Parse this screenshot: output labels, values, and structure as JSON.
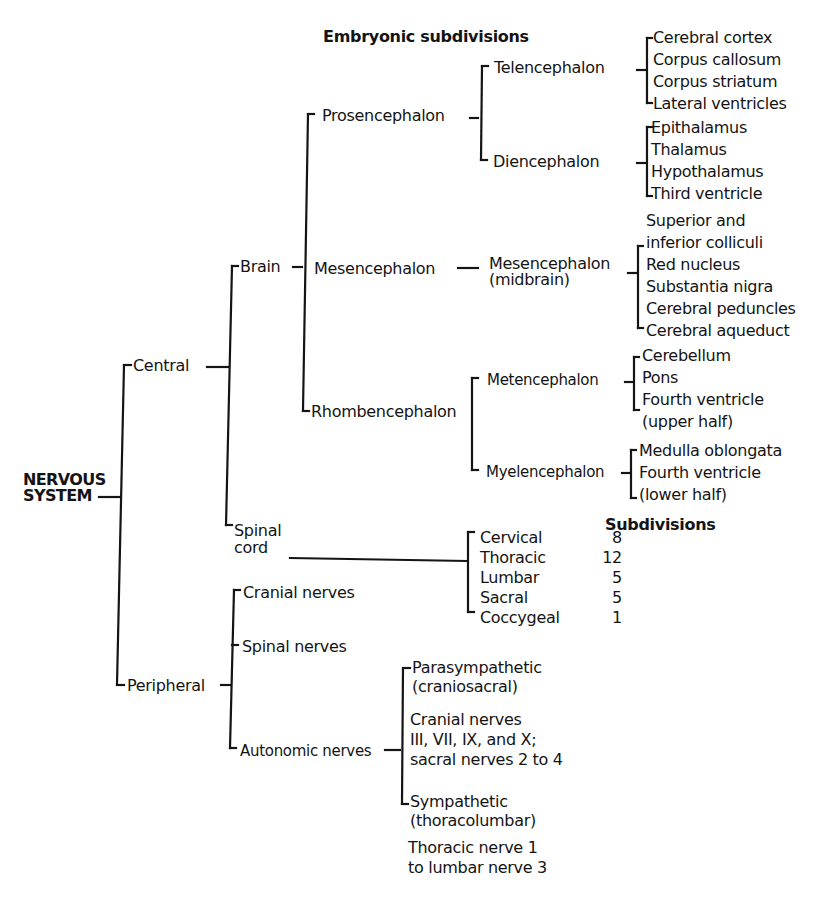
{
  "diagram": {
    "root": "NERVOUS SYSTEM",
    "root_lines": [
      "NERVOUS",
      "SYSTEM"
    ],
    "headers": {
      "embryonic": "Embryonic subdivisions",
      "subdivisions": "Subdivisions"
    },
    "level1": {
      "central": "Central",
      "peripheral": "Peripheral"
    },
    "central": {
      "brain": "Brain",
      "spinal_cord": [
        "Spinal",
        "cord"
      ],
      "embryonic": {
        "prosencephalon": "Prosencephalon",
        "mesencephalon": "Mesencephalon",
        "rhombencephalon": "Rhombencephalon"
      },
      "divisions": {
        "telencephalon": {
          "label": "Telencephalon",
          "structures": [
            "Cerebral cortex",
            "Corpus callosum",
            "Corpus striatum",
            "Lateral ventricles"
          ]
        },
        "diencephalon": {
          "label": "Diencephalon",
          "structures": [
            "Epithalamus",
            "Thalamus",
            "Hypothalamus",
            "Third ventricle"
          ]
        },
        "mesencephalon": {
          "label": [
            "Mesencephalon",
            "(midbrain)"
          ],
          "structures": [
            "Superior and",
            "inferior colliculi",
            "Red nucleus",
            "Substantia nigra",
            "Cerebral peduncles",
            "Cerebral aqueduct"
          ]
        },
        "metencephalon": {
          "label": "Metencephalon",
          "structures": [
            "Cerebellum",
            "Pons",
            "Fourth ventricle",
            "(upper half)"
          ]
        },
        "myelencephalon": {
          "label": "Myelencephalon",
          "structures": [
            "Medulla oblongata",
            "Fourth ventricle",
            "(lower half)"
          ]
        }
      },
      "spinal_subdivisions": [
        {
          "name": "Cervical",
          "count": "8"
        },
        {
          "name": "Thoracic",
          "count": "12"
        },
        {
          "name": "Lumbar",
          "count": "5"
        },
        {
          "name": "Sacral",
          "count": "5"
        },
        {
          "name": "Coccygeal",
          "count": "1"
        }
      ]
    },
    "peripheral": {
      "cranial_nerves": "Cranial nerves",
      "spinal_nerves": "Spinal nerves",
      "autonomic_nerves": "Autonomic nerves",
      "autonomic": {
        "parasympathetic": [
          "Parasympathetic",
          "(craniosacral)"
        ],
        "parasympathetic_detail": [
          "Cranial nerves",
          "III, VII, IX, and X;",
          "sacral nerves 2 to 4"
        ],
        "sympathetic": [
          "Sympathetic",
          "(thoracolumbar)"
        ],
        "sympathetic_detail": [
          "Thoracic nerve 1",
          "to lumbar nerve 3"
        ]
      }
    }
  }
}
